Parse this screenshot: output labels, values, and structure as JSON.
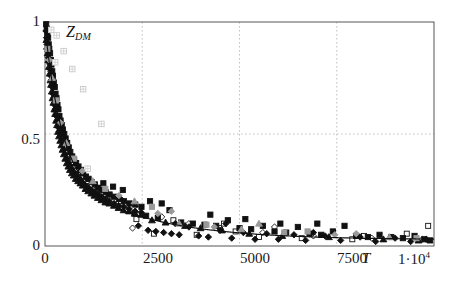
{
  "chart_data": {
    "type": "scatter",
    "title": "",
    "ylabel": "Z_DM",
    "ylabel_text": "Z",
    "ylabel_sub": "DM",
    "xlabel": "T",
    "xlabel_exponent_text": "1·10",
    "xlabel_exponent_sup": "4",
    "xlim": [
      0,
      10000
    ],
    "ylim": [
      0,
      1
    ],
    "xticks": [
      0,
      2500,
      5000,
      7500,
      10000
    ],
    "xticklabels": [
      "0",
      "2500",
      "5000",
      "7500",
      "1·10⁴"
    ],
    "yticks": [
      0,
      0.5,
      1
    ],
    "yticklabels": [
      "0",
      "0.5",
      "1"
    ],
    "grid": "dotted gridlines at y=0.5 and x=2500,5000,7500",
    "legend": "none",
    "fit_curve": {
      "description": "monotonic exponential decay fit through scatter cloud",
      "form": "Z = a*exp(-T/t1) + b*exp(-T/t2) + c",
      "a": 0.62,
      "t1": 420,
      "b": 0.33,
      "t2": 2100,
      "c": 0.028,
      "color": "#111111"
    },
    "series": [
      {
        "name": "filled-square",
        "marker": "square",
        "fill": "#111111",
        "points": [
          [
            30,
            0.99
          ],
          [
            45,
            0.97
          ],
          [
            60,
            0.95
          ],
          [
            80,
            0.93
          ],
          [
            95,
            0.9
          ],
          [
            110,
            0.88
          ],
          [
            130,
            0.86
          ],
          [
            150,
            0.83
          ],
          [
            165,
            0.81
          ],
          [
            185,
            0.78
          ],
          [
            205,
            0.76
          ],
          [
            225,
            0.73
          ],
          [
            250,
            0.71
          ],
          [
            270,
            0.68
          ],
          [
            295,
            0.66
          ],
          [
            320,
            0.63
          ],
          [
            345,
            0.61
          ],
          [
            370,
            0.58
          ],
          [
            400,
            0.56
          ],
          [
            430,
            0.54
          ],
          [
            460,
            0.52
          ],
          [
            495,
            0.5
          ],
          [
            530,
            0.48
          ],
          [
            570,
            0.46
          ],
          [
            610,
            0.44
          ],
          [
            650,
            0.42
          ],
          [
            700,
            0.4
          ],
          [
            750,
            0.385
          ],
          [
            800,
            0.37
          ],
          [
            860,
            0.355
          ],
          [
            920,
            0.34
          ],
          [
            980,
            0.325
          ],
          [
            1050,
            0.31
          ],
          [
            1120,
            0.3
          ],
          [
            1200,
            0.285
          ],
          [
            1280,
            0.275
          ],
          [
            1370,
            0.26
          ],
          [
            1460,
            0.25
          ],
          [
            1560,
            0.24
          ],
          [
            1660,
            0.23
          ],
          [
            1780,
            0.22
          ],
          [
            1900,
            0.21
          ],
          [
            2030,
            0.2
          ],
          [
            2170,
            0.19
          ],
          [
            2320,
            0.185
          ],
          [
            2480,
            0.175
          ],
          [
            1500,
            0.28
          ],
          [
            1750,
            0.265
          ],
          [
            2000,
            0.25
          ],
          [
            2300,
            0.145
          ],
          [
            2600,
            0.135
          ],
          [
            2900,
            0.125
          ],
          [
            3200,
            0.16
          ],
          [
            3500,
            0.105
          ],
          [
            3800,
            0.1
          ],
          [
            4100,
            0.095
          ],
          [
            4400,
            0.09
          ],
          [
            4700,
            0.115
          ],
          [
            5000,
            0.08
          ],
          [
            5300,
            0.075
          ],
          [
            5600,
            0.09
          ],
          [
            5900,
            0.065
          ],
          [
            6200,
            0.06
          ],
          [
            6500,
            0.085
          ],
          [
            6800,
            0.055
          ],
          [
            7100,
            0.05
          ],
          [
            7400,
            0.065
          ],
          [
            7700,
            0.09
          ],
          [
            8000,
            0.045
          ],
          [
            8300,
            0.04
          ],
          [
            8600,
            0.05
          ],
          [
            8900,
            0.04
          ],
          [
            9200,
            0.035
          ],
          [
            9500,
            0.045
          ],
          [
            9750,
            0.03
          ],
          [
            9900,
            0.025
          ],
          [
            3000,
            0.19
          ],
          [
            2700,
            0.2
          ],
          [
            4250,
            0.14
          ],
          [
            5150,
            0.12
          ],
          [
            6050,
            0.1
          ],
          [
            7000,
            0.1
          ]
        ]
      },
      {
        "name": "filled-diamond",
        "marker": "diamond",
        "fill": "#111111",
        "points": [
          [
            25,
            0.96
          ],
          [
            40,
            0.93
          ],
          [
            55,
            0.9
          ],
          [
            70,
            0.87
          ],
          [
            90,
            0.84
          ],
          [
            105,
            0.82
          ],
          [
            125,
            0.79
          ],
          [
            145,
            0.76
          ],
          [
            160,
            0.74
          ],
          [
            180,
            0.71
          ],
          [
            200,
            0.68
          ],
          [
            220,
            0.66
          ],
          [
            245,
            0.63
          ],
          [
            265,
            0.61
          ],
          [
            290,
            0.58
          ],
          [
            315,
            0.56
          ],
          [
            340,
            0.53
          ],
          [
            365,
            0.51
          ],
          [
            395,
            0.49
          ],
          [
            425,
            0.47
          ],
          [
            455,
            0.45
          ],
          [
            490,
            0.43
          ],
          [
            525,
            0.41
          ],
          [
            565,
            0.39
          ],
          [
            605,
            0.375
          ],
          [
            645,
            0.36
          ],
          [
            695,
            0.345
          ],
          [
            745,
            0.33
          ],
          [
            795,
            0.32
          ],
          [
            855,
            0.305
          ],
          [
            915,
            0.295
          ],
          [
            975,
            0.28
          ],
          [
            1045,
            0.27
          ],
          [
            1115,
            0.26
          ],
          [
            1195,
            0.25
          ],
          [
            1275,
            0.24
          ],
          [
            1365,
            0.23
          ],
          [
            1455,
            0.22
          ],
          [
            1555,
            0.21
          ],
          [
            1655,
            0.2
          ],
          [
            1775,
            0.19
          ],
          [
            1895,
            0.18
          ],
          [
            2025,
            0.175
          ],
          [
            2165,
            0.165
          ],
          [
            2315,
            0.155
          ],
          [
            2475,
            0.15
          ],
          [
            2650,
            0.07
          ],
          [
            2850,
            0.065
          ],
          [
            3050,
            0.06
          ],
          [
            3250,
            0.055
          ],
          [
            3450,
            0.05
          ],
          [
            3700,
            0.085
          ],
          [
            3950,
            0.045
          ],
          [
            4200,
            0.04
          ],
          [
            4500,
            0.07
          ],
          [
            4800,
            0.035
          ],
          [
            5100,
            0.06
          ],
          [
            5400,
            0.03
          ],
          [
            5700,
            0.055
          ],
          [
            6000,
            0.03
          ],
          [
            6400,
            0.05
          ],
          [
            6700,
            0.025
          ],
          [
            7200,
            0.045
          ],
          [
            7600,
            0.025
          ],
          [
            8100,
            0.04
          ],
          [
            8500,
            0.02
          ],
          [
            9000,
            0.035
          ],
          [
            9400,
            0.02
          ],
          [
            9800,
            0.03
          ],
          [
            2400,
            0.09
          ],
          [
            3350,
            0.1
          ],
          [
            4650,
            0.1
          ],
          [
            6900,
            0.06
          ]
        ]
      },
      {
        "name": "filled-triangle",
        "marker": "triangle",
        "fill": "#111111",
        "points": [
          [
            35,
            0.92
          ],
          [
            50,
            0.89
          ],
          [
            65,
            0.86
          ],
          [
            85,
            0.83
          ],
          [
            100,
            0.8
          ],
          [
            120,
            0.77
          ],
          [
            140,
            0.74
          ],
          [
            155,
            0.72
          ],
          [
            175,
            0.69
          ],
          [
            195,
            0.66
          ],
          [
            215,
            0.64
          ],
          [
            240,
            0.61
          ],
          [
            260,
            0.59
          ],
          [
            285,
            0.56
          ],
          [
            310,
            0.54
          ],
          [
            335,
            0.51
          ],
          [
            360,
            0.49
          ],
          [
            390,
            0.47
          ],
          [
            420,
            0.45
          ],
          [
            450,
            0.43
          ],
          [
            485,
            0.41
          ],
          [
            520,
            0.39
          ],
          [
            560,
            0.37
          ],
          [
            600,
            0.355
          ],
          [
            640,
            0.34
          ],
          [
            690,
            0.325
          ],
          [
            740,
            0.315
          ],
          [
            790,
            0.3
          ],
          [
            850,
            0.29
          ],
          [
            910,
            0.28
          ],
          [
            970,
            0.27
          ],
          [
            1040,
            0.255
          ],
          [
            1110,
            0.245
          ],
          [
            1190,
            0.235
          ],
          [
            1270,
            0.225
          ],
          [
            1360,
            0.215
          ],
          [
            1450,
            0.205
          ],
          [
            1550,
            0.195
          ],
          [
            1650,
            0.19
          ],
          [
            1770,
            0.18
          ],
          [
            1890,
            0.17
          ],
          [
            2020,
            0.16
          ],
          [
            2160,
            0.155
          ],
          [
            2310,
            0.145
          ],
          [
            2470,
            0.14
          ],
          [
            2750,
            0.115
          ],
          [
            3100,
            0.105
          ],
          [
            3600,
            0.09
          ],
          [
            4000,
            0.08
          ],
          [
            4550,
            0.07
          ],
          [
            5250,
            0.055
          ],
          [
            6100,
            0.045
          ],
          [
            7300,
            0.04
          ],
          [
            8700,
            0.03
          ],
          [
            9600,
            0.025
          ]
        ]
      },
      {
        "name": "open-square",
        "marker": "square",
        "fill": "none",
        "stroke": "#111111",
        "points": [
          [
            120,
            0.82
          ],
          [
            200,
            0.72
          ],
          [
            300,
            0.62
          ],
          [
            420,
            0.52
          ],
          [
            560,
            0.44
          ],
          [
            720,
            0.375
          ],
          [
            900,
            0.325
          ],
          [
            1100,
            0.29
          ],
          [
            1350,
            0.255
          ],
          [
            1650,
            0.225
          ],
          [
            1950,
            0.2
          ],
          [
            2350,
            0.12
          ],
          [
            2800,
            0.055
          ],
          [
            3300,
            0.115
          ],
          [
            3900,
            0.05
          ],
          [
            4600,
            0.1
          ],
          [
            5500,
            0.04
          ],
          [
            6600,
            0.035
          ],
          [
            7900,
            0.03
          ],
          [
            9300,
            0.055
          ],
          [
            9850,
            0.09
          ],
          [
            2100,
            0.16
          ],
          [
            4900,
            0.065
          ],
          [
            8200,
            0.045
          ]
        ]
      },
      {
        "name": "open-diamond",
        "marker": "diamond",
        "fill": "none",
        "stroke": "#111111",
        "points": [
          [
            150,
            0.78
          ],
          [
            260,
            0.66
          ],
          [
            380,
            0.56
          ],
          [
            520,
            0.47
          ],
          [
            680,
            0.4
          ],
          [
            870,
            0.345
          ],
          [
            1080,
            0.3
          ],
          [
            1320,
            0.265
          ],
          [
            1600,
            0.235
          ],
          [
            1950,
            0.21
          ],
          [
            2400,
            0.165
          ],
          [
            3000,
            0.13
          ],
          [
            3700,
            0.1
          ],
          [
            4500,
            0.08
          ],
          [
            5600,
            0.06
          ],
          [
            6900,
            0.045
          ],
          [
            8400,
            0.035
          ],
          [
            9700,
            0.03
          ],
          [
            2250,
            0.08
          ],
          [
            5900,
            0.085
          ]
        ]
      },
      {
        "name": "gray-marker",
        "marker": "mixed",
        "fill": "#9a9a9a",
        "points": [
          [
            60,
            0.88
          ],
          [
            110,
            0.83
          ],
          [
            180,
            0.75
          ],
          [
            280,
            0.65
          ],
          [
            400,
            0.55
          ],
          [
            550,
            0.46
          ],
          [
            740,
            0.39
          ],
          [
            960,
            0.335
          ],
          [
            1230,
            0.29
          ],
          [
            1550,
            0.255
          ],
          [
            1900,
            0.225
          ],
          [
            2300,
            0.2
          ],
          [
            2750,
            0.175
          ],
          [
            3250,
            0.155
          ],
          [
            3450,
            0.1
          ],
          [
            4150,
            0.095
          ],
          [
            4350,
            0.085
          ],
          [
            5050,
            0.075
          ],
          [
            6150,
            0.06
          ],
          [
            7450,
            0.05
          ],
          [
            8850,
            0.04
          ],
          [
            9550,
            0.035
          ],
          [
            2900,
            0.145
          ],
          [
            5500,
            0.1
          ],
          [
            6750,
            0.065
          ],
          [
            8000,
            0.055
          ]
        ]
      },
      {
        "name": "grid-square-outlier",
        "marker": "grid-square",
        "fill": "#c8c8c8",
        "points": [
          [
            300,
            0.94
          ],
          [
            480,
            0.87
          ],
          [
            700,
            0.79
          ],
          [
            980,
            0.7
          ],
          [
            1450,
            0.545
          ],
          [
            1100,
            0.345
          ],
          [
            260,
            0.82
          ],
          [
            160,
            0.965
          ]
        ]
      }
    ]
  },
  "axis": {
    "y_ticklabels": [
      "1",
      "0.5",
      "0"
    ],
    "x_ticklabels": [
      "0",
      "2500",
      "5000",
      "7500"
    ],
    "x_exponent_base": "1·10",
    "x_exponent_power": "4",
    "x_axis_symbol": "T",
    "y_axis_symbol": "Z",
    "y_axis_subscript": "DM"
  },
  "colors": {
    "marker_dark": "#111111",
    "marker_gray": "#9a9a9a",
    "outlier_gray": "#c8c8c8",
    "gridline": "#c0c0c0",
    "axis": "#444444",
    "curve": "#111111",
    "background": "#ffffff"
  }
}
